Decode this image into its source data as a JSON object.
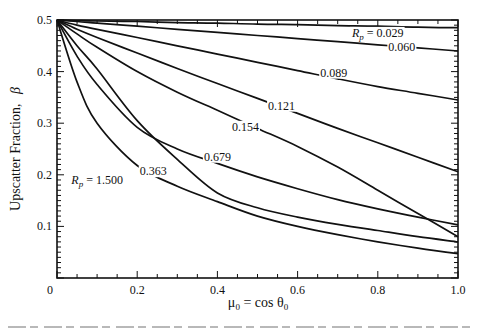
{
  "chart_data": {
    "type": "line",
    "title": "",
    "xlabel": "μ0 = cos θ0",
    "ylabel": "Upscatter Fraction, β",
    "xlim": [
      0,
      1.0
    ],
    "ylim": [
      0,
      0.5
    ],
    "x_ticks": [
      0,
      0.2,
      0.4,
      0.6,
      0.8,
      1.0
    ],
    "x_tick_labels": [
      "0",
      "0.2",
      "0.4",
      "0.6",
      "0.8",
      "1.0"
    ],
    "y_ticks": [
      0.1,
      0.2,
      0.3,
      0.4,
      0.5
    ],
    "y_tick_labels": [
      "0.1",
      "0.2",
      "0.3",
      "0.4",
      "0.5"
    ],
    "grid": false,
    "legend": "inline labels",
    "x": [
      0,
      0.05,
      0.1,
      0.2,
      0.3,
      0.4,
      0.5,
      0.6,
      0.7,
      0.8,
      0.9,
      1.0
    ],
    "series": [
      {
        "name": "Rp = 0.029",
        "label": "Rp = 0.029",
        "values": [
          0.5,
          0.499,
          0.498,
          0.497,
          0.495,
          0.494,
          0.492,
          0.491,
          0.489,
          0.488,
          0.486,
          0.485
        ]
      },
      {
        "name": "Rp = 0.060",
        "label": "0.060",
        "values": [
          0.5,
          0.497,
          0.494,
          0.488,
          0.482,
          0.476,
          0.47,
          0.464,
          0.458,
          0.452,
          0.446,
          0.44
        ]
      },
      {
        "name": "Rp = 0.089",
        "label": "0.089",
        "values": [
          0.5,
          0.49,
          0.482,
          0.466,
          0.45,
          0.434,
          0.418,
          0.402,
          0.386,
          0.371,
          0.358,
          0.345
        ]
      },
      {
        "name": "Rp = 0.121",
        "label": "0.121",
        "values": [
          0.5,
          0.482,
          0.466,
          0.436,
          0.406,
          0.377,
          0.348,
          0.319,
          0.29,
          0.262,
          0.234,
          0.206
        ]
      },
      {
        "name": "Rp = 0.154",
        "label": "0.154",
        "values": [
          0.5,
          0.473,
          0.447,
          0.4,
          0.36,
          0.325,
          0.29,
          0.255,
          0.215,
          0.17,
          0.125,
          0.08
        ]
      },
      {
        "name": "Rp = 0.363",
        "label": "0.363",
        "values": [
          0.5,
          0.45,
          0.405,
          0.305,
          0.23,
          0.165,
          0.136,
          0.118,
          0.104,
          0.092,
          0.08,
          0.07
        ]
      },
      {
        "name": "Rp = 0.679",
        "label": "0.679",
        "values": [
          0.5,
          0.43,
          0.375,
          0.292,
          0.25,
          0.222,
          0.196,
          0.173,
          0.152,
          0.134,
          0.118,
          0.103
        ]
      },
      {
        "name": "Rp = 1.500",
        "label": "Rp = 1.500",
        "values": [
          0.5,
          0.38,
          0.3,
          0.218,
          0.178,
          0.148,
          0.12,
          0.1,
          0.084,
          0.07,
          0.058,
          0.047
        ]
      }
    ],
    "annotations": [
      {
        "text": "Rp = 0.029",
        "x": 0.8,
        "y": 0.475
      },
      {
        "text": "0.060",
        "x": 0.86,
        "y": 0.447
      },
      {
        "text": "0.089",
        "x": 0.69,
        "y": 0.398
      },
      {
        "text": "0.121",
        "x": 0.56,
        "y": 0.334
      },
      {
        "text": "0.154",
        "x": 0.47,
        "y": 0.293
      },
      {
        "text": "0.679",
        "x": 0.4,
        "y": 0.235
      },
      {
        "text": "0.363",
        "x": 0.24,
        "y": 0.207
      },
      {
        "text": "Rp = 1.500",
        "x": 0.1,
        "y": 0.19
      }
    ]
  },
  "axes": {
    "ylabel_main": "Upscatter  Fraction,",
    "ylabel_symbol": "β",
    "xlabel_mu": "μ",
    "xlabel_sub0": "0",
    "xlabel_eq": " = cos θ",
    "xlabel_sub1": "0"
  },
  "style": {
    "line_color": "#111111",
    "background": "#ffffff",
    "caption_color": "#9a9a9a"
  }
}
